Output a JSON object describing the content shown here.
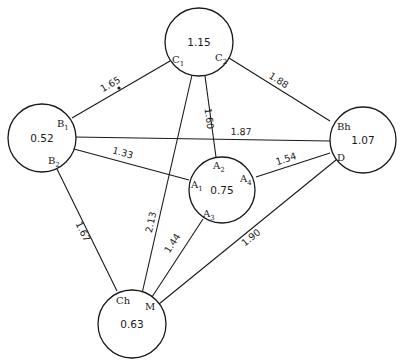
{
  "nodes": [
    {
      "id": "C",
      "value": "1.15",
      "cx": 199,
      "cy": 42,
      "r": 34,
      "ports": [
        {
          "base": "C",
          "sub": "1",
          "x": 172,
          "y": 63
        },
        {
          "base": "C",
          "sub": "2",
          "x": 215,
          "y": 61
        }
      ]
    },
    {
      "id": "B",
      "value": "0.52",
      "cx": 42,
      "cy": 138,
      "r": 34,
      "ports": [
        {
          "base": "B",
          "sub": "1",
          "x": 57,
          "y": 127
        },
        {
          "base": "B",
          "sub": "2",
          "x": 48,
          "y": 164
        }
      ]
    },
    {
      "id": "BhD",
      "value": "1.07",
      "cx": 363,
      "cy": 140,
      "r": 33,
      "ports": [
        {
          "base": "Bh",
          "sub": "",
          "x": 337,
          "y": 130
        },
        {
          "base": "D",
          "sub": "",
          "x": 337,
          "y": 161
        }
      ]
    },
    {
      "id": "A",
      "value": "0.75",
      "cx": 222,
      "cy": 190,
      "r": 33,
      "ports": [
        {
          "base": "A",
          "sub": "2",
          "x": 213,
          "y": 169
        },
        {
          "base": "A",
          "sub": "1",
          "x": 191,
          "y": 188
        },
        {
          "base": "A",
          "sub": "4",
          "x": 240,
          "y": 182
        },
        {
          "base": "A",
          "sub": "3",
          "x": 203,
          "y": 217
        }
      ]
    },
    {
      "id": "ChM",
      "value": "0.63",
      "cx": 132,
      "cy": 324,
      "r": 34,
      "ports": [
        {
          "base": "Ch",
          "sub": "",
          "x": 116,
          "y": 304
        },
        {
          "base": "M",
          "sub": "",
          "x": 145,
          "y": 310
        }
      ]
    }
  ],
  "edges": [
    {
      "label": "1.65",
      "x1": 170,
      "y1": 61,
      "x2": 72,
      "y2": 118,
      "lx": 112,
      "ly": 87
    },
    {
      "label": "1.88",
      "x1": 229,
      "y1": 58,
      "x2": 330,
      "y2": 121,
      "lx": 277,
      "ly": 83
    },
    {
      "label": "2.13",
      "x1": 192,
      "y1": 75,
      "x2": 141,
      "y2": 298,
      "lx": 154,
      "ly": 223
    },
    {
      "label": "1.60",
      "x1": 205,
      "y1": 76,
      "x2": 216,
      "y2": 157,
      "lx": 206,
      "ly": 119
    },
    {
      "label": "1.87",
      "x1": 74,
      "y1": 137,
      "x2": 330,
      "y2": 141,
      "lx": 241,
      "ly": 135
    },
    {
      "label": "1.33",
      "x1": 74,
      "y1": 149,
      "x2": 189,
      "y2": 180,
      "lx": 122,
      "ly": 156
    },
    {
      "label": "1.67",
      "x1": 57,
      "y1": 169,
      "x2": 117,
      "y2": 291,
      "lx": 80,
      "ly": 233
    },
    {
      "label": "1.54",
      "x1": 256,
      "y1": 177,
      "x2": 330,
      "y2": 153,
      "lx": 287,
      "ly": 162
    },
    {
      "label": "1.44",
      "x1": 203,
      "y1": 219,
      "x2": 152,
      "y2": 297,
      "lx": 175,
      "ly": 245
    },
    {
      "label": "1.90",
      "x1": 336,
      "y1": 160,
      "x2": 159,
      "y2": 304,
      "lx": 253,
      "ly": 240
    }
  ],
  "decorations": {
    "dot": {
      "cx": 119,
      "cy": 88,
      "r": 1.6
    }
  },
  "colors": {
    "stroke": "#1a1a1a",
    "background": "#ffffff"
  }
}
